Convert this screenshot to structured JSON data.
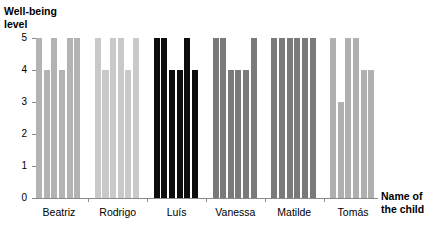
{
  "chart_data": {
    "type": "bar",
    "title": "",
    "ylabel": "Well-being level",
    "xlabel": "Name of the child",
    "ylabel_lines": [
      "Well-being",
      "level"
    ],
    "xlabel_lines": [
      "Name of",
      "the child"
    ],
    "categories": [
      "Beatriz",
      "Rodrigo",
      "Luís",
      "Vanessa",
      "Matilde",
      "Tomás"
    ],
    "ylim": [
      0,
      5
    ],
    "yticks": [
      0,
      1,
      2,
      3,
      4,
      5
    ],
    "ytick_labels": [
      "0",
      "1",
      "2",
      "3",
      "4",
      "5"
    ],
    "grid": false,
    "legend": "none",
    "bars_per_category": 6,
    "series": [
      {
        "name": "Beatriz",
        "values": [
          5,
          4,
          5,
          4,
          5,
          5
        ],
        "color": "#b3b3b3"
      },
      {
        "name": "Rodrigo",
        "values": [
          5,
          4,
          5,
          5,
          4,
          5
        ],
        "color": "#c9c9c9"
      },
      {
        "name": "Luís",
        "values": [
          5,
          5,
          4,
          4,
          5,
          4
        ],
        "color": "#0d0d0d"
      },
      {
        "name": "Vanessa",
        "values": [
          5,
          5,
          4,
          4,
          4,
          5
        ],
        "color": "#7a7a7a"
      },
      {
        "name": "Matilde",
        "values": [
          5,
          5,
          5,
          5,
          5,
          5
        ],
        "color": "#7a7a7a"
      },
      {
        "name": "Tomás",
        "values": [
          5,
          3,
          5,
          5,
          4,
          4
        ],
        "color": "#b0b0b0"
      }
    ]
  },
  "colors": {
    "axis": "#8a8a8a",
    "text": "#000000",
    "background": "#ffffff"
  }
}
